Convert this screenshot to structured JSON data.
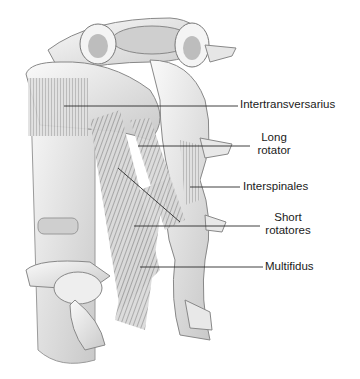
{
  "figure": {
    "colors": {
      "bone": "#f2f2f2",
      "bone_shade": "#bdbdbd",
      "muscle": "#7a7a7a",
      "line": "#2a2a2a",
      "text": "#1a1a1a"
    }
  },
  "labels": [
    {
      "id": "intertransversarius",
      "lines": [
        "Intertransversarius"
      ],
      "x": 240,
      "y": 98
    },
    {
      "id": "long-rotator",
      "lines": [
        "Long",
        "rotator"
      ],
      "x": 254,
      "y": 131
    },
    {
      "id": "interspinales",
      "lines": [
        "Interspinales"
      ],
      "x": 243,
      "y": 180
    },
    {
      "id": "short-rotatores",
      "lines": [
        "Short",
        "rotatores"
      ],
      "x": 263,
      "y": 211
    },
    {
      "id": "multifidus",
      "lines": [
        "Multifidus"
      ],
      "x": 265,
      "y": 259
    }
  ],
  "leaders": [
    {
      "id": "intertransversarius",
      "x1": 64,
      "y1": 106,
      "x2": 238,
      "y2": 106
    },
    {
      "id": "long-rotator",
      "x1": 138,
      "y1": 146,
      "x2": 250,
      "y2": 146
    },
    {
      "id": "interspinales",
      "x1": 190,
      "y1": 187,
      "x2": 240,
      "y2": 187
    },
    {
      "id": "short-rotatores",
      "x1": 134,
      "y1": 226,
      "x2": 260,
      "y2": 226
    },
    {
      "id": "multifidus",
      "x1": 140,
      "y1": 267,
      "x2": 263,
      "y2": 267
    }
  ]
}
